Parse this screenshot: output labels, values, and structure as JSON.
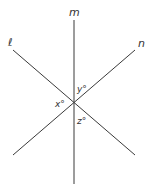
{
  "figure": {
    "lines": [
      {
        "name": "m",
        "label": "m",
        "x1": 74,
        "y1": 20,
        "x2": 74,
        "y2": 184,
        "label_x": 69,
        "label_y": 16
      },
      {
        "name": "l",
        "label": "ℓ",
        "x1": 13,
        "y1": 50,
        "x2": 135,
        "y2": 155,
        "label_x": 8,
        "label_y": 46
      },
      {
        "name": "n",
        "label": "n",
        "x1": 13,
        "y1": 155,
        "x2": 135,
        "y2": 50,
        "label_x": 138,
        "label_y": 47
      }
    ],
    "angles": [
      {
        "name": "x",
        "label": "x°",
        "x": 55,
        "y": 107
      },
      {
        "name": "y",
        "label": "y°",
        "x": 77,
        "y": 92
      },
      {
        "name": "z",
        "label": "z°",
        "x": 77,
        "y": 124
      }
    ],
    "intersection": {
      "x": 74,
      "y": 103
    },
    "stroke_color": "#3a3a3a"
  }
}
